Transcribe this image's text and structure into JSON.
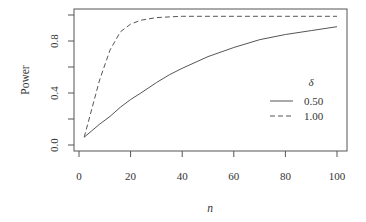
{
  "chart_data": {
    "type": "line",
    "title": "",
    "xlabel": "n",
    "ylabel": "Power",
    "xlim": [
      0,
      100
    ],
    "ylim": [
      0.0,
      1.0
    ],
    "x_ticks": [
      0,
      20,
      40,
      60,
      80,
      100
    ],
    "x_tick_labels": [
      "0",
      "20",
      "40",
      "60",
      "80",
      "100"
    ],
    "y_ticks": [
      0.0,
      0.2,
      0.4,
      0.6,
      0.8,
      1.0
    ],
    "y_tick_labels": [
      "0.0",
      "",
      "0.4",
      "",
      "0.8",
      ""
    ],
    "grid": false,
    "legend": {
      "title": "δ",
      "position": "right-middle-inside",
      "entries": [
        {
          "label": "0.50",
          "linestyle": "solid"
        },
        {
          "label": "1.00",
          "linestyle": "dashed"
        }
      ]
    },
    "x": [
      2,
      5,
      8,
      12,
      16,
      20,
      24,
      30,
      35,
      40,
      50,
      60,
      70,
      80,
      90,
      100
    ],
    "series": [
      {
        "name": "0.50",
        "linestyle": "solid",
        "values": [
          0.06,
          0.11,
          0.16,
          0.22,
          0.29,
          0.35,
          0.4,
          0.48,
          0.54,
          0.59,
          0.68,
          0.75,
          0.81,
          0.85,
          0.88,
          0.91
        ]
      },
      {
        "name": "1.00",
        "linestyle": "dashed",
        "values": [
          0.06,
          0.28,
          0.5,
          0.73,
          0.87,
          0.93,
          0.96,
          0.98,
          0.985,
          0.99,
          0.99,
          0.99,
          0.99,
          0.99,
          0.99,
          0.99
        ]
      }
    ],
    "colors": {
      "axis": "#555555",
      "line": "#555555",
      "text": "#333333"
    }
  }
}
